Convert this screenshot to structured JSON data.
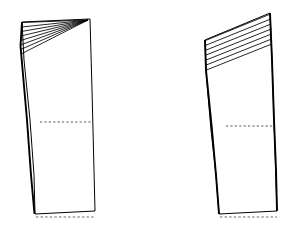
{
  "canvas": {
    "width": 301,
    "height": 239,
    "background_color": "#ffffff",
    "line_color": "#000000",
    "guide_color": "#5a5a5a",
    "title": "Pattern block slash-and-spread diagram"
  },
  "figures": [
    {
      "id": "left-pattern-piece",
      "name": "Left pattern piece with converging pivot slash lines",
      "slash_style": "converging",
      "slash_count": 8,
      "pivot_point": {
        "x": 88,
        "y": 20
      },
      "outline_points": "22,22 90,19 95,211 35,214",
      "heavy_edges": [
        {
          "name": "left-side-seam",
          "points": "22,22 20.5,46 27,120 31,175 34.5,214"
        }
      ],
      "outline_path": "M22,22 L90,19 L92,90 L93.5,150 L95,211 L35,214 L34,175 L30,120 L24,60 Z",
      "slash_lines": [
        {
          "x1": 22.5,
          "y1": 22.5,
          "x2": 88,
          "y2": 20
        },
        {
          "x1": 21.8,
          "y1": 27.0,
          "x2": 88,
          "y2": 20
        },
        {
          "x1": 21.2,
          "y1": 31.5,
          "x2": 88,
          "y2": 20
        },
        {
          "x1": 20.8,
          "y1": 36.0,
          "x2": 88,
          "y2": 20
        },
        {
          "x1": 20.6,
          "y1": 40.5,
          "x2": 88,
          "y2": 20
        },
        {
          "x1": 20.5,
          "y1": 45.0,
          "x2": 88,
          "y2": 20
        },
        {
          "x1": 20.6,
          "y1": 49.5,
          "x2": 88,
          "y2": 20
        },
        {
          "x1": 21.0,
          "y1": 54.0,
          "x2": 88,
          "y2": 20
        }
      ],
      "guide_line": {
        "x1": 40,
        "y1": 122,
        "x2": 92,
        "y2": 122,
        "label": "hip-guide-line"
      },
      "hem_line": {
        "x1": 36,
        "y1": 217,
        "x2": 95,
        "y2": 217,
        "label": "hem-allowance-line"
      }
    },
    {
      "id": "right-pattern-piece",
      "name": "Right pattern piece with parallel slash lines",
      "slash_style": "parallel",
      "slash_count": 7,
      "outline_points": "205,40 270,13 277,211 219,214",
      "heavy_edges": [
        {
          "name": "left-side-seam",
          "points": "205,40 206,70 212,130 216,175 219,214"
        },
        {
          "name": "right-side-seam",
          "points": "270,13 272,60 274,120 276,170 277,211"
        }
      ],
      "outline_path": "M205,40 L270,13 L272,60 L274,120 L277,211 L219,214 L216,175 L211,130 L206,72 Z",
      "slash_lines": [
        {
          "x1": 205.5,
          "y1": 40.5,
          "x2": 270.5,
          "y2": 14.0
        },
        {
          "x1": 205.2,
          "y1": 45.5,
          "x2": 270.7,
          "y2": 19.0
        },
        {
          "x1": 205.0,
          "y1": 50.5,
          "x2": 271.0,
          "y2": 24.0
        },
        {
          "x1": 204.9,
          "y1": 55.5,
          "x2": 271.2,
          "y2": 29.0
        },
        {
          "x1": 204.9,
          "y1": 60.5,
          "x2": 271.4,
          "y2": 34.0
        },
        {
          "x1": 205.0,
          "y1": 65.5,
          "x2": 271.6,
          "y2": 39.0
        },
        {
          "x1": 205.2,
          "y1": 70.5,
          "x2": 271.8,
          "y2": 44.0
        }
      ],
      "guide_line": {
        "x1": 226,
        "y1": 126,
        "x2": 274,
        "y2": 126,
        "label": "hip-guide-line"
      },
      "hem_line": {
        "x1": 220,
        "y1": 217,
        "x2": 277,
        "y2": 217,
        "label": "hem-allowance-line"
      }
    }
  ]
}
